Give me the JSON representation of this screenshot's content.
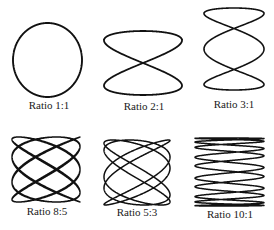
{
  "figure": {
    "stroke_color": "#111111",
    "background": "#ffffff",
    "panels": [
      {
        "label": "Ratio 1:1",
        "fx": 1,
        "fy": 1,
        "phase": 1.5708,
        "box": [
          13,
          23,
          82,
          97
        ],
        "label_pos": [
          49,
          105
        ],
        "stroke": 1.9
      },
      {
        "label": "Ratio 2:1",
        "fx": 2,
        "fy": 1,
        "phase": 0.0,
        "box": [
          104,
          31,
          182,
          95
        ],
        "label_pos": [
          144,
          106
        ],
        "stroke": 1.8
      },
      {
        "label": "Ratio 3:1",
        "fx": 3,
        "fy": 1,
        "phase": 1.5708,
        "box": [
          204,
          8,
          264,
          90
        ],
        "label_pos": [
          234,
          104
        ],
        "stroke": 1.6
      },
      {
        "label": "Ratio 8:5",
        "fx": 8,
        "fy": 5,
        "phase": 0.35,
        "box": [
          12,
          137,
          80,
          202
        ],
        "label_pos": [
          47,
          211
        ],
        "stroke": 1.4
      },
      {
        "label": "Ratio 5:3",
        "fx": 5,
        "fy": 3,
        "phase": 0.3,
        "box": [
          104,
          140,
          170,
          205
        ],
        "label_pos": [
          137,
          212
        ],
        "stroke": 1.5
      },
      {
        "label": "Ratio 10:1",
        "fx": 10,
        "fy": 1,
        "phase": 0.25,
        "box": [
          195,
          138,
          264,
          206
        ],
        "label_pos": [
          230,
          214
        ],
        "stroke": 1.5
      }
    ]
  }
}
